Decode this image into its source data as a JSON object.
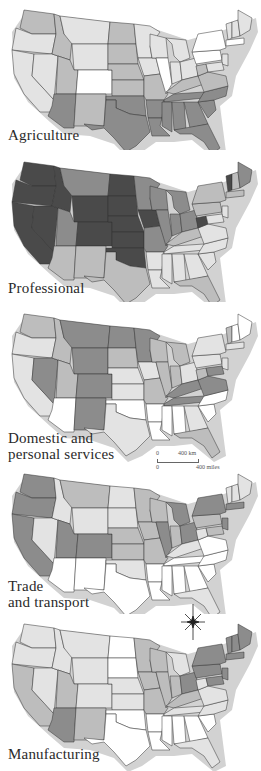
{
  "colors": {
    "shade0": "#ffffff",
    "shade1": "#e3e3e3",
    "shade2": "#bdbdbd",
    "shade3": "#8c8c8c",
    "shade4": "#4a4a4a",
    "coast_shadow": "#d2d2d2",
    "border": "#333333"
  },
  "maps": [
    {
      "id": "agriculture",
      "label": "Agriculture",
      "shades": {
        "WA": 2,
        "OR": 1,
        "CA": 1,
        "ID": 2,
        "NV": 1,
        "MT": 1,
        "WY": 1,
        "UT": 2,
        "CO": 0,
        "AZ": 3,
        "NM": 2,
        "ND": 2,
        "SD": 2,
        "NE": 2,
        "KS": 2,
        "OK": 3,
        "TX": 3,
        "MN": 1,
        "IA": 1,
        "MO": 2,
        "AR": 3,
        "LA": 3,
        "WI": 1,
        "IL": 0,
        "MI": 1,
        "IN": 1,
        "OH": 1,
        "KY": 2,
        "TN": 3,
        "MS": 3,
        "AL": 3,
        "GA": 3,
        "FL": 3,
        "SC": 3,
        "NC": 3,
        "VA": 2,
        "WV": 2,
        "PA": 0,
        "NY": 0,
        "ME": 1,
        "VT": 1,
        "NH": 1,
        "MA": 0,
        "NJ": 1,
        "MD": 1
      }
    },
    {
      "id": "professional",
      "label": "Professional",
      "shades": {
        "WA": 4,
        "OR": 4,
        "CA": 4,
        "ID": 4,
        "NV": 4,
        "MT": 3,
        "WY": 4,
        "UT": 3,
        "CO": 4,
        "AZ": 2,
        "NM": 2,
        "ND": 4,
        "SD": 4,
        "NE": 4,
        "KS": 4,
        "OK": 4,
        "TX": 2,
        "MN": 3,
        "IA": 4,
        "MO": 3,
        "AR": 1,
        "LA": 1,
        "WI": 3,
        "IL": 3,
        "MI": 3,
        "IN": 3,
        "OH": 3,
        "KY": 2,
        "TN": 1,
        "MS": 1,
        "AL": 1,
        "GA": 1,
        "FL": 2,
        "SC": 1,
        "NC": 1,
        "VA": 1,
        "WV": 4,
        "PA": 2,
        "NY": 2,
        "ME": 3,
        "VT": 4,
        "NH": 2,
        "MA": 2,
        "NJ": 1,
        "MD": 1
      }
    },
    {
      "id": "domestic",
      "label_line1": "Domestic and",
      "label_line2": "personal services",
      "shades": {
        "WA": 2,
        "OR": 1,
        "CA": 1,
        "ID": 2,
        "NV": 3,
        "MT": 3,
        "WY": 3,
        "UT": 2,
        "CO": 3,
        "AZ": 0,
        "NM": 3,
        "ND": 3,
        "SD": 2,
        "NE": 1,
        "KS": 1,
        "OK": 0,
        "TX": 1,
        "MN": 3,
        "IA": 1,
        "MO": 2,
        "AR": 0,
        "LA": 0,
        "WI": 2,
        "IL": 2,
        "MI": 2,
        "IN": 2,
        "OH": 1,
        "KY": 3,
        "TN": 3,
        "MS": 0,
        "AL": 0,
        "GA": 1,
        "FL": 2,
        "SC": 0,
        "NC": 0,
        "VA": 3,
        "WV": 2,
        "PA": 1,
        "NY": 1,
        "ME": 0,
        "VT": 2,
        "NH": 0,
        "MA": 1,
        "NJ": 1,
        "MD": 3
      }
    },
    {
      "id": "trade",
      "label_line1": "Trade",
      "label_line2": "and transport",
      "shades": {
        "WA": 3,
        "OR": 3,
        "CA": 3,
        "ID": 1,
        "NV": 1,
        "MT": 2,
        "WY": 1,
        "UT": 3,
        "CO": 3,
        "AZ": 0,
        "NM": 0,
        "ND": 1,
        "SD": 1,
        "NE": 2,
        "KS": 2,
        "OK": 1,
        "TX": 0,
        "MN": 2,
        "IA": 2,
        "MO": 2,
        "AR": 0,
        "LA": 0,
        "WI": 2,
        "IL": 3,
        "MI": 3,
        "IN": 2,
        "OH": 3,
        "KY": 1,
        "TN": 0,
        "MS": 0,
        "AL": 0,
        "GA": 0,
        "FL": 1,
        "SC": 0,
        "NC": 0,
        "VA": 0,
        "WV": 1,
        "PA": 2,
        "NY": 3,
        "ME": 1,
        "VT": 1,
        "NH": 1,
        "MA": 3,
        "NJ": 3,
        "MD": 2
      }
    },
    {
      "id": "manufacturing",
      "label": "Manufacturing",
      "shades": {
        "WA": 1,
        "OR": 1,
        "CA": 2,
        "ID": 1,
        "NV": 1,
        "MT": 1,
        "WY": 1,
        "UT": 2,
        "CO": 1,
        "AZ": 3,
        "NM": 2,
        "ND": 0,
        "SD": 0,
        "NE": 1,
        "KS": 1,
        "OK": 0,
        "TX": 0,
        "MN": 2,
        "IA": 2,
        "MO": 2,
        "AR": 0,
        "LA": 0,
        "WI": 2,
        "IL": 2,
        "MI": 1,
        "IN": 2,
        "OH": 3,
        "KY": 2,
        "TN": 1,
        "MS": 0,
        "AL": 0,
        "GA": 0,
        "FL": 1,
        "SC": 0,
        "NC": 1,
        "VA": 1,
        "WV": 1,
        "PA": 3,
        "NY": 3,
        "ME": 3,
        "VT": 3,
        "NH": 3,
        "MA": 3,
        "NJ": 3,
        "MD": 3
      }
    }
  ],
  "scale_bar": {
    "km_zero": "0",
    "km_label": "400 km",
    "mi_zero": "0",
    "mi_label": "400 miles"
  },
  "compass": {
    "icon": "compass-rose-icon"
  }
}
